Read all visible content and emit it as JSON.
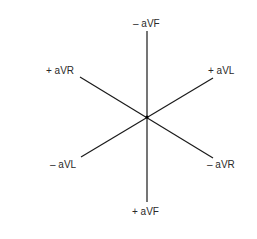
{
  "diagram": {
    "type": "hexaxial-augmented-limb-leads",
    "center": {
      "x": 147,
      "y": 117
    },
    "line_color": "#1a1a1a",
    "axes": [
      {
        "name": "aVF-axis",
        "x1": 147,
        "y1": 31,
        "x2": 147,
        "y2": 202
      },
      {
        "name": "aVR-axis",
        "x1": 80,
        "y1": 77,
        "x2": 213,
        "y2": 158
      },
      {
        "name": "aVL-axis",
        "x1": 81,
        "y1": 157,
        "x2": 213,
        "y2": 78
      }
    ],
    "labels": {
      "neg_avf": "– aVF",
      "pos_avr": "+ aVR",
      "pos_avl": "+ aVL",
      "neg_avl": "– aVL",
      "neg_avr": "– aVR",
      "pos_avf": "+ aVF"
    }
  }
}
